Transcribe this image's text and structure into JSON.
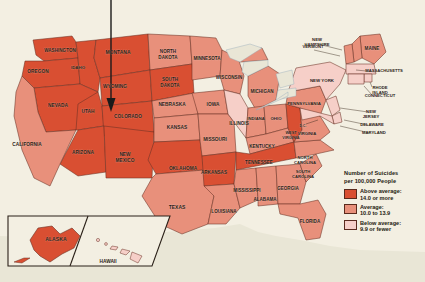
{
  "figure": {
    "type": "choropleth-map",
    "region": "United States",
    "background_color": "#f3efe2",
    "water_color": "#e9e6d6",
    "border_color": "#6b3124",
    "pointer": {
      "name": "annotation-arrow",
      "points_to": "UTAH",
      "color": "#1a1a1a"
    }
  },
  "legend": {
    "title_line1": "Number of Suicides",
    "title_line2": "per 100,000 People",
    "entries": [
      {
        "key": "above",
        "label_line1": "Above average:",
        "label_line2": "14.0 or more",
        "color": "#d94f32",
        "min": 14.0
      },
      {
        "key": "average",
        "label_line1": "Average:",
        "label_line2": "10.0 to 13.9",
        "color": "#e8907b",
        "min": 10.0,
        "max": 13.9
      },
      {
        "key": "below",
        "label_line1": "Below average:",
        "label_line2": "9.9 or fewer",
        "color": "#f6cfc8",
        "max": 9.9
      }
    ]
  },
  "insets": [
    {
      "name": "alaska-inset",
      "label": "ALASKA",
      "category": "above"
    },
    {
      "name": "hawaii-inset",
      "label": "HAWAII",
      "category": "below"
    }
  ],
  "chart_data": {
    "type": "heatmap",
    "title": "Number of Suicides per 100,000 People",
    "categories": [
      "Above average: 14.0 or more",
      "Average: 10.0 to 13.9",
      "Below average: 9.9 or fewer"
    ],
    "states": [
      {
        "label": "WASHINGTON",
        "category": "above",
        "lx": 60,
        "ly": 51,
        "fs": 4.6
      },
      {
        "label": "OREGON",
        "category": "above",
        "lx": 38,
        "ly": 72,
        "fs": 4.8
      },
      {
        "label": "IDAHO",
        "category": "above",
        "lx": 78,
        "ly": 68,
        "fs": 4.4
      },
      {
        "label": "MONTANA",
        "category": "above",
        "lx": 118,
        "ly": 53,
        "fs": 5.0
      },
      {
        "label": "WYOMING",
        "category": "above",
        "lx": 115,
        "ly": 87,
        "fs": 4.8
      },
      {
        "label": "NEVADA",
        "category": "above",
        "lx": 58,
        "ly": 106,
        "fs": 4.8
      },
      {
        "label": "UTAH",
        "category": "above",
        "lx": 88,
        "ly": 112,
        "fs": 4.8
      },
      {
        "label": "COLORADO",
        "category": "above",
        "lx": 128,
        "ly": 117,
        "fs": 4.8
      },
      {
        "label": "ARIZONA",
        "category": "above",
        "lx": 83,
        "ly": 153,
        "fs": 4.8
      },
      {
        "label": "NEW MEXICO",
        "category": "above",
        "lx": 125,
        "ly": 155,
        "fs": 4.8
      },
      {
        "label": "CALIFORNIA",
        "category": "average",
        "lx": 27,
        "ly": 145,
        "fs": 4.8
      },
      {
        "label": "NORTH DAKOTA",
        "category": "average",
        "lx": 168,
        "ly": 52,
        "fs": 4.6
      },
      {
        "label": "SOUTH DAKOTA",
        "category": "above",
        "lx": 170,
        "ly": 80,
        "fs": 4.6
      },
      {
        "label": "NEBRASKA",
        "category": "average",
        "lx": 172,
        "ly": 105,
        "fs": 4.8
      },
      {
        "label": "KANSAS",
        "category": "average",
        "lx": 177,
        "ly": 128,
        "fs": 4.8
      },
      {
        "label": "OKLAHOMA",
        "category": "above",
        "lx": 183,
        "ly": 169,
        "fs": 4.8
      },
      {
        "label": "TEXAS",
        "category": "average",
        "lx": 177,
        "ly": 208,
        "fs": 5.0
      },
      {
        "label": "MINNESOTA",
        "category": "average",
        "lx": 207,
        "ly": 59,
        "fs": 4.6
      },
      {
        "label": "IOWA",
        "category": "average",
        "lx": 213,
        "ly": 105,
        "fs": 4.8
      },
      {
        "label": "MISSOURI",
        "category": "average",
        "lx": 215,
        "ly": 140,
        "fs": 4.8
      },
      {
        "label": "ARKANSAS",
        "category": "above",
        "lx": 214,
        "ly": 173,
        "fs": 4.6
      },
      {
        "label": "LOUISIANA",
        "category": "average",
        "lx": 224,
        "ly": 212,
        "fs": 4.6
      },
      {
        "label": "WISCONSIN",
        "category": "average",
        "lx": 229,
        "ly": 78,
        "fs": 4.6
      },
      {
        "label": "ILLINOIS",
        "category": "below",
        "lx": 239,
        "ly": 124,
        "fs": 4.6
      },
      {
        "label": "MICHIGAN",
        "category": "average",
        "lx": 262,
        "ly": 92,
        "fs": 4.6
      },
      {
        "label": "INDIANA",
        "category": "average",
        "lx": 256,
        "ly": 119,
        "fs": 4.2
      },
      {
        "label": "OHIO",
        "category": "average",
        "lx": 276,
        "ly": 119,
        "fs": 4.4
      },
      {
        "label": "KENTUCKY",
        "category": "average",
        "lx": 262,
        "ly": 147,
        "fs": 4.6
      },
      {
        "label": "TENNESSEE",
        "category": "above",
        "lx": 259,
        "ly": 163,
        "fs": 4.6
      },
      {
        "label": "MISSISSIPPI",
        "category": "average",
        "lx": 247,
        "ly": 191,
        "fs": 4.6
      },
      {
        "label": "ALABAMA",
        "category": "average",
        "lx": 265,
        "ly": 200,
        "fs": 4.6
      },
      {
        "label": "GEORGIA",
        "category": "average",
        "lx": 288,
        "ly": 189,
        "fs": 4.6
      },
      {
        "label": "FLORIDA",
        "category": "average",
        "lx": 310,
        "ly": 222,
        "fs": 4.6
      },
      {
        "label": "SOUTH CAROLINA",
        "category": "average",
        "lx": 303,
        "ly": 172,
        "fs": 4.2
      },
      {
        "label": "NORTH CAROLINA",
        "category": "average",
        "lx": 305,
        "ly": 158,
        "fs": 4.2
      },
      {
        "label": "WEST VIRGINIA",
        "category": "above",
        "lx": 291,
        "ly": 133,
        "fs": 3.9
      },
      {
        "label": "VIRGINIA",
        "category": "average",
        "lx": 307,
        "ly": 134,
        "fs": 4.2
      },
      {
        "label": "PENNSYLVANIA",
        "category": "average",
        "lx": 304,
        "ly": 104,
        "fs": 4.4
      },
      {
        "label": "NEW YORK",
        "category": "below",
        "lx": 322,
        "ly": 81,
        "fs": 4.4
      },
      {
        "label": "MAINE",
        "category": "average",
        "lx": 372,
        "ly": 49,
        "fs": 4.6
      },
      {
        "label": "NEW HAMPSHIRE",
        "category": "average",
        "lx": 317,
        "ly": 40,
        "fs": 4.2
      },
      {
        "label": "VERMONT",
        "category": "average",
        "lx": 313,
        "ly": 47,
        "fs": 4.2
      },
      {
        "label": "MASSACHUSETTS",
        "category": "below",
        "lx": 384,
        "ly": 71,
        "fs": 4.2
      },
      {
        "label": "RHODE ISLAND",
        "category": "below",
        "lx": 380,
        "ly": 88,
        "fs": 4.2
      },
      {
        "label": "CONNECTICUT",
        "category": "below",
        "lx": 380,
        "ly": 96,
        "fs": 4.2
      },
      {
        "label": "NEW JERSEY",
        "category": "below",
        "lx": 371,
        "ly": 112,
        "fs": 4.2
      },
      {
        "label": "DELAWARE",
        "category": "below",
        "lx": 372,
        "ly": 125,
        "fs": 4.2
      },
      {
        "label": "MARYLAND",
        "category": "below",
        "lx": 374,
        "ly": 133,
        "fs": 4.2
      },
      {
        "label": "D.C.",
        "category": "below",
        "lx": 303,
        "ly": 126,
        "fs": 3.4
      }
    ]
  }
}
